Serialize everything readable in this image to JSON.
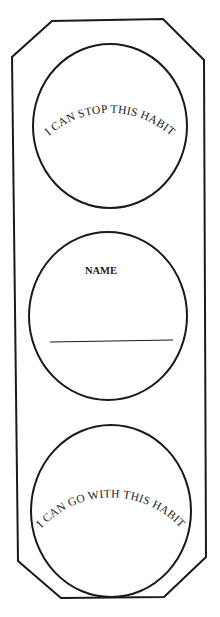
{
  "worksheet": {
    "title": "Traffic light habit worksheet",
    "colors": {
      "ink": "#1a1a1a",
      "paper": "#ffffff"
    },
    "top_light": {
      "label": "I CAN STOP THIS HABIT"
    },
    "middle_light": {
      "label": "NAME",
      "name_line_value": ""
    },
    "bottom_light": {
      "label": "I CAN GO WITH THIS HABIT"
    }
  }
}
